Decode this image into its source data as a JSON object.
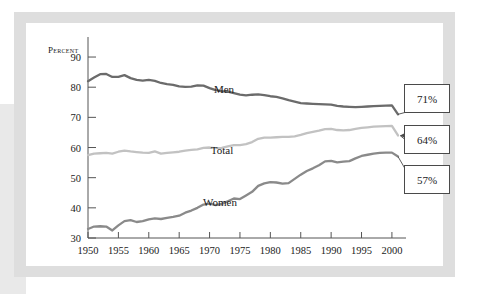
{
  "figure": {
    "axis_title": "Percent",
    "y_ticks": [
      30,
      40,
      50,
      60,
      70,
      80,
      90
    ],
    "x_ticks": [
      1950,
      1955,
      1960,
      1965,
      1970,
      1975,
      1980,
      1985,
      1990,
      1995,
      2000
    ],
    "labels": {
      "men": "Men",
      "total": "Total",
      "women": "Women"
    },
    "callouts": {
      "men": "71%",
      "total": "64%",
      "women": "57%"
    },
    "colors": {
      "men": "#6b6b6b",
      "total": "#c2c2c2",
      "women": "#8a8a8a",
      "axis": "#555555",
      "frame": "#dedede"
    }
  },
  "chart_data": {
    "type": "line",
    "title": "",
    "xlabel": "",
    "ylabel": "Percent",
    "xlim": [
      1950,
      2001
    ],
    "ylim": [
      30,
      92
    ],
    "xticks": [
      1950,
      1955,
      1960,
      1965,
      1970,
      1975,
      1980,
      1985,
      1990,
      1995,
      2000
    ],
    "yticks": [
      30,
      40,
      50,
      60,
      70,
      80,
      90
    ],
    "grid": false,
    "legend": "inline-labels",
    "annotations": [
      {
        "series": "Men",
        "text": "71%",
        "x": 2001,
        "y": 71
      },
      {
        "series": "Total",
        "text": "64%",
        "x": 2001,
        "y": 64
      },
      {
        "series": "Women",
        "text": "57%",
        "x": 2001,
        "y": 57
      }
    ],
    "x": [
      1950,
      1951,
      1952,
      1953,
      1954,
      1955,
      1956,
      1957,
      1958,
      1959,
      1960,
      1961,
      1962,
      1963,
      1964,
      1965,
      1966,
      1967,
      1968,
      1969,
      1970,
      1971,
      1972,
      1973,
      1974,
      1975,
      1976,
      1977,
      1978,
      1979,
      1980,
      1981,
      1982,
      1983,
      1984,
      1985,
      1986,
      1987,
      1988,
      1989,
      1990,
      1991,
      1992,
      1993,
      1994,
      1995,
      1996,
      1997,
      1998,
      1999,
      2000,
      2001
    ],
    "series": [
      {
        "name": "Men",
        "color": "#6b6b6b",
        "values": [
          82.0,
          83.2,
          84.3,
          84.4,
          83.4,
          83.4,
          84.0,
          83.0,
          82.4,
          82.2,
          82.4,
          82.1,
          81.4,
          81.0,
          80.8,
          80.3,
          80.1,
          80.2,
          80.6,
          80.5,
          79.7,
          79.0,
          78.7,
          78.5,
          78.0,
          77.5,
          77.3,
          77.5,
          77.6,
          77.4,
          77.0,
          76.8,
          76.3,
          75.7,
          75.2,
          74.7,
          74.6,
          74.5,
          74.4,
          74.3,
          74.2,
          73.8,
          73.6,
          73.5,
          73.4,
          73.5,
          73.6,
          73.7,
          73.8,
          73.9,
          74.0,
          71.0
        ]
      },
      {
        "name": "Total",
        "color": "#c2c2c2",
        "values": [
          57.5,
          58.0,
          58.1,
          58.2,
          58.0,
          58.6,
          59.0,
          58.7,
          58.5,
          58.3,
          58.2,
          58.7,
          58.0,
          58.2,
          58.4,
          58.6,
          59.0,
          59.2,
          59.4,
          59.9,
          60.0,
          59.8,
          59.9,
          60.4,
          60.8,
          60.8,
          61.1,
          61.8,
          62.9,
          63.3,
          63.3,
          63.4,
          63.5,
          63.5,
          63.7,
          64.2,
          64.8,
          65.2,
          65.6,
          66.1,
          66.2,
          65.8,
          65.7,
          65.8,
          66.2,
          66.5,
          66.7,
          66.9,
          67.0,
          67.1,
          67.2,
          64.0
        ]
      },
      {
        "name": "Women",
        "color": "#8a8a8a",
        "values": [
          33.0,
          33.8,
          33.9,
          33.8,
          32.5,
          34.2,
          35.6,
          35.9,
          35.3,
          35.6,
          36.2,
          36.5,
          36.3,
          36.7,
          37.0,
          37.4,
          38.4,
          39.1,
          40.0,
          41.1,
          41.4,
          40.9,
          41.3,
          42.2,
          43.1,
          42.9,
          44.1,
          45.3,
          47.3,
          48.1,
          48.5,
          48.4,
          48.0,
          48.2,
          49.6,
          51.0,
          52.2,
          53.1,
          54.1,
          55.4,
          55.6,
          55.1,
          55.3,
          55.5,
          56.4,
          57.2,
          57.6,
          58.0,
          58.2,
          58.3,
          58.3,
          57.0
        ]
      }
    ]
  }
}
